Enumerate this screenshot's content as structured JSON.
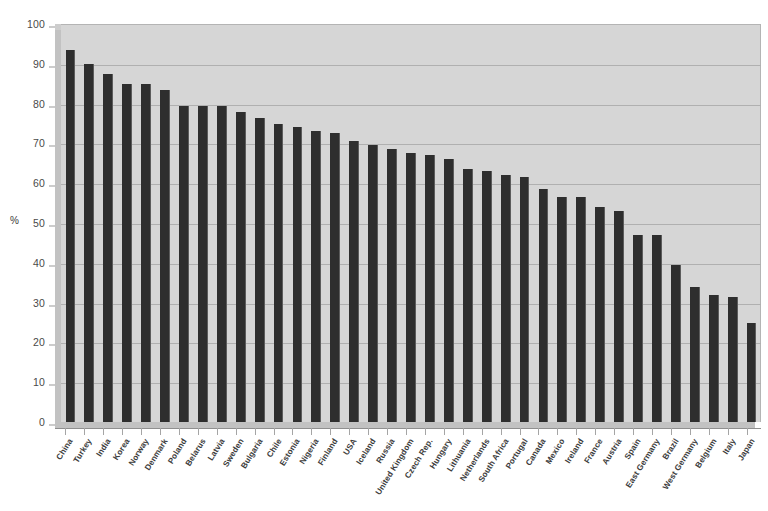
{
  "chart_data": {
    "type": "bar",
    "title": "",
    "subtitle": "",
    "xlabel": "",
    "ylabel": "%",
    "ylim": [
      0,
      100
    ],
    "ytick_step": 10,
    "yticks": [
      0,
      10,
      20,
      30,
      40,
      50,
      60,
      70,
      80,
      90,
      100
    ],
    "grid": true,
    "legend": false,
    "legend_position": "none",
    "orientation": "vertical",
    "bar_color": "#2e2e2e",
    "plot_background": "#d6d6d6",
    "page_background": "#ffffff",
    "categories": [
      "China",
      "Turkey",
      "India",
      "Korea",
      "Norway",
      "Denmark",
      "Poland",
      "Belarus",
      "Latvia",
      "Sweden",
      "Bulgaria",
      "Chile",
      "Estonia",
      "Nigeria",
      "Finland",
      "USA",
      "Iceland",
      "Russia",
      "United Kingdom",
      "Czech Rep.",
      "Hungary",
      "Lithuania",
      "Netherlands",
      "South Africa",
      "Portugal",
      "Canada",
      "Mexico",
      "Ireland",
      "France",
      "Austria",
      "Spain",
      "East Germany",
      "Brazil",
      "West Germany",
      "Belgium",
      "Italy",
      "Japan"
    ],
    "values": [
      93.5,
      90,
      87.5,
      85,
      85,
      83.5,
      79.5,
      79.5,
      79.5,
      78,
      76.5,
      75.5,
      74.5,
      73.5,
      73,
      71,
      70,
      69,
      68,
      67.5,
      66.5,
      66,
      64,
      63.5,
      62.5,
      61.5,
      59,
      57,
      56.5,
      56.5,
      54.5,
      53.5,
      47.5,
      47.5,
      39.5,
      34,
      32
    ],
    "values_tail_note": ""
  },
  "chart_data_full": {
    "categories": [
      "China",
      "Turkey",
      "India",
      "Korea",
      "Norway",
      "Denmark",
      "Poland",
      "Belarus",
      "Latvia",
      "Sweden",
      "Bulgaria",
      "Chile",
      "Estonia",
      "Nigeria",
      "Finland",
      "USA",
      "Iceland",
      "Russia",
      "United Kingdom",
      "Czech Rep.",
      "Hungary",
      "Lithuania",
      "Netherlands",
      "South Africa",
      "Portugal",
      "Canada",
      "Mexico",
      "Ireland",
      "France",
      "Austria",
      "Spain",
      "East Germany",
      "Brazil",
      "West Germany",
      "Belgium",
      "Italy",
      "Japan"
    ]
  },
  "bars": [
    {
      "label": "China",
      "value": 93.5
    },
    {
      "label": "Turkey",
      "value": 90.0
    },
    {
      "label": "India",
      "value": 87.5
    },
    {
      "label": "Korea",
      "value": 85.0
    },
    {
      "label": "Norway",
      "value": 85.0
    },
    {
      "label": "Denmark",
      "value": 83.5
    },
    {
      "label": "Poland",
      "value": 79.5
    },
    {
      "label": "Belarus",
      "value": 79.5
    },
    {
      "label": "Latvia",
      "value": 79.5
    },
    {
      "label": "Sweden",
      "value": 78.0
    },
    {
      "label": "Bulgaria",
      "value": 76.5
    },
    {
      "label": "Chile",
      "value": 75.5
    },
    {
      "label": "Estonia",
      "value": 74.5
    },
    {
      "label": "Nigeria",
      "value": 73.5
    },
    {
      "label": "Finland",
      "value": 73.0
    },
    {
      "label": "USA",
      "value": 71.0
    },
    {
      "label": "Iceland",
      "value": 70.0
    },
    {
      "label": "Russia",
      "value": 69.0
    },
    {
      "label": "United Kingdom",
      "value": 68.0
    },
    {
      "label": "Czech Rep.",
      "value": 67.5
    },
    {
      "label": "Hungary",
      "value": 66.5
    },
    {
      "label": "Lithuania",
      "value": 64.0
    },
    {
      "label": "Netherlands",
      "value": 63.5
    },
    {
      "label": "South Africa",
      "value": 62.5
    },
    {
      "label": "Portugal",
      "value": 61.5
    },
    {
      "label": "Canada",
      "value": 59.0
    },
    {
      "label": "Mexico",
      "value": 56.5
    },
    {
      "label": "Ireland",
      "value": 56.5
    },
    {
      "label": "France",
      "value": 54.5
    },
    {
      "label": "Austria",
      "value": 53.5
    },
    {
      "label": "Spain",
      "value": 47.5
    },
    {
      "label": "East Germany",
      "value": 47.5
    },
    {
      "label": "Brazil",
      "value": 39.5
    },
    {
      "label": "West Germany",
      "value": 34.0
    },
    {
      "label": "Belgium",
      "value": 32.0
    },
    {
      "label": "Italy",
      "value": 31.5
    },
    {
      "label": "Japan",
      "value": 25.0
    }
  ],
  "bars_corrected": [
    {
      "label": "China",
      "value": 93.5
    },
    {
      "label": "Turkey",
      "value": 90.0
    },
    {
      "label": "India",
      "value": 87.5
    },
    {
      "label": "Korea",
      "value": 85.0
    },
    {
      "label": "Norway",
      "value": 85.0
    },
    {
      "label": "Denmark",
      "value": 83.5
    },
    {
      "label": "Poland",
      "value": 79.5
    },
    {
      "label": "Belarus",
      "value": 79.5
    },
    {
      "label": "Latvia",
      "value": 79.5
    },
    {
      "label": "Sweden",
      "value": 78.0
    },
    {
      "label": "Bulgaria",
      "value": 76.5
    },
    {
      "label": "Chile",
      "value": 75.0
    },
    {
      "label": "Estonia",
      "value": 74.0
    },
    {
      "label": "Nigeria",
      "value": 73.0
    },
    {
      "label": "Finland",
      "value": 72.5
    },
    {
      "label": "USA",
      "value": 70.5
    },
    {
      "label": "Iceland",
      "value": 69.5
    },
    {
      "label": "Russia",
      "value": 68.5
    },
    {
      "label": "United Kingdom",
      "value": 67.5
    },
    {
      "label": "Czech Rep.",
      "value": 67.0
    },
    {
      "label": "Hungary",
      "value": 66.0
    },
    {
      "label": "Lithuania",
      "value": 63.5
    },
    {
      "label": "Netherlands",
      "value": 63.0
    },
    {
      "label": "South Africa",
      "value": 62.0
    },
    {
      "label": "Portugal",
      "value": 61.5
    },
    {
      "label": "Canada",
      "value": 58.5
    },
    {
      "label": "Mexico",
      "value": 56.5
    },
    {
      "label": "Ireland",
      "value": 56.5
    },
    {
      "label": "France",
      "value": 54.0
    },
    {
      "label": "Austria",
      "value": 53.0
    },
    {
      "label": "Spain",
      "value": 47.0
    },
    {
      "label": "East Germany",
      "value": 47.0
    },
    {
      "label": "Brazil",
      "value": 39.5
    },
    {
      "label": "West Germany",
      "value": 34.0
    },
    {
      "label": "Belgium",
      "value": 32.0
    },
    {
      "label": "Italy",
      "value": 31.5
    },
    {
      "label": "Japan",
      "value": 25.0
    }
  ],
  "axis": {
    "y_title": "%",
    "y_max_label": "100",
    "y_min_label": "0"
  }
}
